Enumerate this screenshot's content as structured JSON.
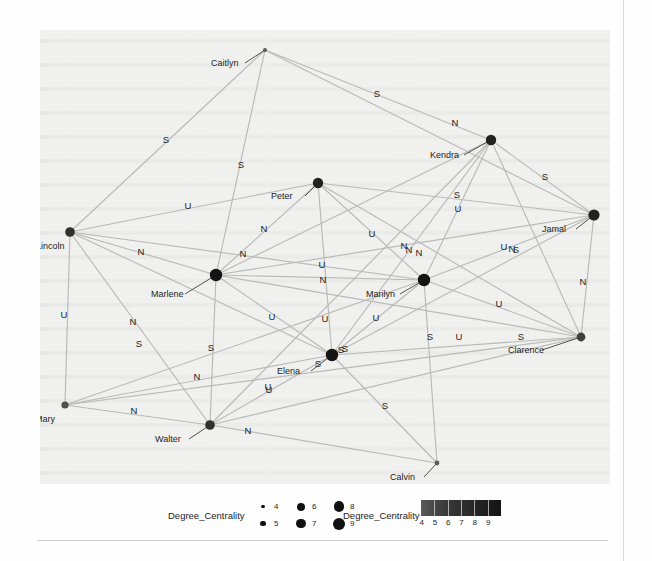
{
  "figure": {
    "background_color": "#f0f0ee",
    "node_color": "#1a1a1a",
    "edge_color": "#b9b9b9"
  },
  "legends": [
    {
      "id": "size-legend",
      "title": "Degree_Centrality",
      "encoding": "size",
      "entries": [
        {
          "value": "4",
          "radius": 1.6
        },
        {
          "value": "5",
          "radius": 2.8
        },
        {
          "value": "6",
          "radius": 4.0
        },
        {
          "value": "7",
          "radius": 4.6
        },
        {
          "value": "8",
          "radius": 5.4
        },
        {
          "value": "9",
          "radius": 6.0
        }
      ]
    },
    {
      "id": "color-legend",
      "title": "Degree_Centrality",
      "encoding": "color",
      "ticks": [
        "4",
        "5",
        "6",
        "7",
        "8",
        "9"
      ],
      "gradient_from": "#5b5b5b",
      "gradient_to": "#141414"
    }
  ],
  "chart_data": {
    "type": "network",
    "title": "",
    "xlabel": "",
    "ylabel": "",
    "grid": false,
    "legend_position": "bottom",
    "node_size_field": "Degree_Centrality",
    "node_color_field": "Degree_Centrality",
    "value_range": [
      4,
      9
    ],
    "edge_label_values": [
      "N",
      "U",
      "S"
    ],
    "nodes": [
      {
        "id": "Caitlyn",
        "label": "Caitlyn",
        "x": 265,
        "y": 50,
        "degree_centrality": 4,
        "r": 2.0,
        "label_x": 211,
        "label_y": 66,
        "leader": true
      },
      {
        "id": "Kendra",
        "label": "Kendra",
        "x": 491,
        "y": 140,
        "degree_centrality": 8,
        "r": 5.2,
        "label_x": 430,
        "label_y": 158,
        "leader": true
      },
      {
        "id": "Peter",
        "label": "Peter",
        "x": 318,
        "y": 183,
        "degree_centrality": 8,
        "r": 5.2,
        "label_x": 271,
        "label_y": 199,
        "leader": true
      },
      {
        "id": "Jamal",
        "label": "Jamal",
        "x": 594,
        "y": 215,
        "degree_centrality": 8,
        "r": 5.6,
        "label_x": 542,
        "label_y": 232,
        "leader": true
      },
      {
        "id": "Lincoln",
        "label": "Lincoln",
        "x": 70,
        "y": 232,
        "degree_centrality": 7,
        "r": 4.8,
        "label_x": 36,
        "label_y": 249,
        "leader": false
      },
      {
        "id": "Marlene",
        "label": "Marlene",
        "x": 216,
        "y": 275,
        "degree_centrality": 9,
        "r": 6.2,
        "label_x": 151,
        "label_y": 297,
        "leader": true
      },
      {
        "id": "Marilyn",
        "label": "Marilyn",
        "x": 424,
        "y": 280,
        "degree_centrality": 9,
        "r": 6.2,
        "label_x": 366,
        "label_y": 297,
        "leader": true
      },
      {
        "id": "Clarence",
        "label": "Clarence",
        "x": 581,
        "y": 337,
        "degree_centrality": 6,
        "r": 4.4,
        "label_x": 508,
        "label_y": 353,
        "leader": true
      },
      {
        "id": "Elena",
        "label": "Elena",
        "x": 332,
        "y": 355,
        "degree_centrality": 9,
        "r": 6.2,
        "label_x": 277,
        "label_y": 374,
        "leader": true
      },
      {
        "id": "Mary",
        "label": "Mary",
        "x": 65,
        "y": 405,
        "degree_centrality": 5,
        "r": 3.6,
        "label_x": 35,
        "label_y": 422,
        "leader": false
      },
      {
        "id": "Walter",
        "label": "Walter",
        "x": 210,
        "y": 425,
        "degree_centrality": 7,
        "r": 4.8,
        "label_x": 155,
        "label_y": 442,
        "leader": true
      },
      {
        "id": "Calvin",
        "label": "Calvin",
        "x": 437,
        "y": 463,
        "degree_centrality": 4,
        "r": 2.4,
        "label_x": 390,
        "label_y": 480,
        "leader": true
      }
    ],
    "edges": [
      {
        "source": "Caitlyn",
        "target": "Lincoln",
        "label": "S",
        "lx": 166,
        "ly": 143
      },
      {
        "source": "Caitlyn",
        "target": "Marlene",
        "label": "S",
        "lx": 241,
        "ly": 168
      },
      {
        "source": "Caitlyn",
        "target": "Kendra",
        "label": "S",
        "lx": 377,
        "ly": 97
      },
      {
        "source": "Caitlyn",
        "target": "Jamal",
        "label": "N",
        "lx": 455,
        "ly": 126
      },
      {
        "source": "Kendra",
        "target": "Jamal",
        "label": "S",
        "lx": 545,
        "ly": 180
      },
      {
        "source": "Kendra",
        "target": "Marilyn",
        "label": "U",
        "lx": 458,
        "ly": 212
      },
      {
        "source": "Kendra",
        "target": "Elena",
        "label": "S",
        "lx": 457,
        "ly": 198
      },
      {
        "source": "Kendra",
        "target": "Clarence",
        "label": "N",
        "lx": 512,
        "ly": 252
      },
      {
        "source": "Kendra",
        "target": "Marlene",
        "label": "N",
        "lx": 409,
        "ly": 253
      },
      {
        "source": "Kendra",
        "target": "Walter",
        "label": "S",
        "lx": 345,
        "ly": 352
      },
      {
        "source": "Peter",
        "target": "Lincoln",
        "label": "U",
        "lx": 188,
        "ly": 209
      },
      {
        "source": "Peter",
        "target": "Marlene",
        "label": "N",
        "lx": 264,
        "ly": 232
      },
      {
        "source": "Peter",
        "target": "Jamal",
        "label": "U",
        "lx": 372,
        "ly": 237
      },
      {
        "source": "Peter",
        "target": "Marilyn",
        "label": "N",
        "lx": 404,
        "ly": 249
      },
      {
        "source": "Peter",
        "target": "Elena",
        "label": "U",
        "lx": 322,
        "ly": 268
      },
      {
        "source": "Peter",
        "target": "Clarence",
        "label": "N",
        "lx": 419,
        "ly": 256
      },
      {
        "source": "Lincoln",
        "target": "Marlene",
        "label": "N",
        "lx": 141,
        "ly": 255
      },
      {
        "source": "Lincoln",
        "target": "Marilyn",
        "label": "N",
        "lx": 243,
        "ly": 257
      },
      {
        "source": "Lincoln",
        "target": "Mary",
        "label": "U",
        "lx": 64,
        "ly": 318
      },
      {
        "source": "Lincoln",
        "target": "Walter",
        "label": "S",
        "lx": 139,
        "ly": 347
      },
      {
        "source": "Lincoln",
        "target": "Elena",
        "label": "N",
        "lx": 133,
        "ly": 325
      },
      {
        "source": "Marlene",
        "target": "Marilyn",
        "label": "N",
        "lx": 323,
        "ly": 283
      },
      {
        "source": "Marlene",
        "target": "Elena",
        "label": "U",
        "lx": 272,
        "ly": 320
      },
      {
        "source": "Marlene",
        "target": "Walter",
        "label": "S",
        "lx": 211,
        "ly": 351
      },
      {
        "source": "Marlene",
        "target": "Clarence",
        "label": "U",
        "lx": 325,
        "ly": 322
      },
      {
        "source": "Marlene",
        "target": "Jamal",
        "label": "U",
        "lx": 504,
        "ly": 250
      },
      {
        "source": "Marilyn",
        "target": "Jamal",
        "label": "S",
        "lx": 516,
        "ly": 253
      },
      {
        "source": "Marilyn",
        "target": "Clarence",
        "label": "U",
        "lx": 499,
        "ly": 307
      },
      {
        "source": "Marilyn",
        "target": "Elena",
        "label": "U",
        "lx": 376,
        "ly": 321
      },
      {
        "source": "Marilyn",
        "target": "Calvin",
        "label": "S",
        "lx": 430,
        "ly": 340
      },
      {
        "source": "Marilyn",
        "target": "Mary",
        "label": "N",
        "lx": 197,
        "ly": 380
      },
      {
        "source": "Jamal",
        "target": "Clarence",
        "label": "N",
        "lx": 583,
        "ly": 285
      },
      {
        "source": "Jamal",
        "target": "Elena",
        "label": "U",
        "lx": 459,
        "ly": 340
      },
      {
        "source": "Clarence",
        "target": "Elena",
        "label": "S",
        "lx": 341,
        "ly": 353
      },
      {
        "source": "Clarence",
        "target": "Mary",
        "label": "U",
        "lx": 268,
        "ly": 390
      },
      {
        "source": "Clarence",
        "target": "Walter",
        "label": "S",
        "lx": 521,
        "ly": 340
      },
      {
        "source": "Elena",
        "target": "Walter",
        "label": "U",
        "lx": 269,
        "ly": 393
      },
      {
        "source": "Elena",
        "target": "Calvin",
        "label": "S",
        "lx": 385,
        "ly": 409
      },
      {
        "source": "Elena",
        "target": "Mary",
        "label": "S",
        "lx": 318,
        "ly": 367
      },
      {
        "source": "Mary",
        "target": "Walter",
        "label": "N",
        "lx": 134,
        "ly": 414
      },
      {
        "source": "Walter",
        "target": "Calvin",
        "label": "N",
        "lx": 248,
        "ly": 434
      }
    ]
  }
}
